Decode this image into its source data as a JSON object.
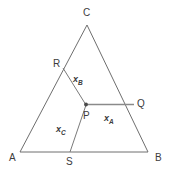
{
  "figure": {
    "background_color": "#ffffff",
    "stroke_color": "#6e6e6e",
    "segment_color": "#7a7a7a",
    "label_color": "#3c3c3c",
    "width": 170,
    "height": 173
  },
  "points": {
    "A": {
      "label": "A",
      "x": 20,
      "y": 152
    },
    "B": {
      "label": "B",
      "x": 148,
      "y": 152
    },
    "C": {
      "label": "C",
      "x": 87,
      "y": 25
    },
    "P": {
      "label": "P",
      "x": 86,
      "y": 105
    },
    "Q": {
      "label": "Q",
      "x": 134,
      "y": 104
    },
    "R": {
      "label": "R",
      "x": 63,
      "y": 68
    },
    "S": {
      "label": "S",
      "x": 70,
      "y": 152
    }
  },
  "segments": {
    "x_A": {
      "label": "x",
      "subscript": "A",
      "from": "P",
      "to": "Q"
    },
    "x_B": {
      "label": "x",
      "subscript": "B",
      "from": "R",
      "to": "P"
    },
    "x_C": {
      "label": "x",
      "subscript": "C",
      "from": "S",
      "to": "P"
    }
  },
  "label_positions": {
    "A": {
      "x": 9,
      "y": 153
    },
    "B": {
      "x": 155,
      "y": 153
    },
    "C": {
      "x": 83,
      "y": 8
    },
    "P": {
      "x": 83,
      "y": 111
    },
    "Q": {
      "x": 137,
      "y": 99
    },
    "R": {
      "x": 53,
      "y": 59
    },
    "S": {
      "x": 66,
      "y": 157
    },
    "x_A": {
      "x": 104,
      "y": 114
    },
    "x_B": {
      "x": 73,
      "y": 75
    },
    "x_C": {
      "x": 56,
      "y": 125
    }
  }
}
